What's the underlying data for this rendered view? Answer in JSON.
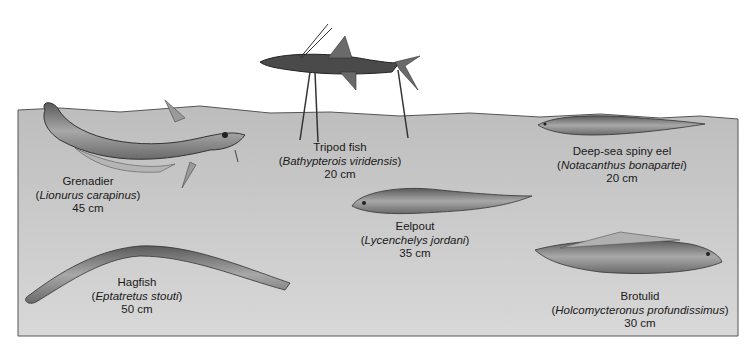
{
  "figure": {
    "type": "deep-sea fish illustration",
    "colors": {
      "background": "#ffffff",
      "seafloor": "#c9c9c9",
      "seafloor_edge": "#555555",
      "fish_body": "#8a8a8a",
      "text": "#1a1a1a"
    }
  },
  "species": [
    {
      "common_name": "Grenadier",
      "scientific_name": "Lionurus carapinus",
      "length": "45 cm"
    },
    {
      "common_name": "Tripod fish",
      "scientific_name": "Bathypterois viridensis",
      "length": "20 cm"
    },
    {
      "common_name": "Deep-sea spiny eel",
      "scientific_name": "Notacanthus bonapartei",
      "length": "20 cm"
    },
    {
      "common_name": "Eelpout",
      "scientific_name": "Lycenchelys jordani",
      "length": "35 cm"
    },
    {
      "common_name": "Hagfish",
      "scientific_name": "Eptatretus stouti",
      "length": "50 cm"
    },
    {
      "common_name": "Brotulid",
      "scientific_name": "Holcomycteronus profundissimus",
      "length": "30 cm"
    }
  ]
}
